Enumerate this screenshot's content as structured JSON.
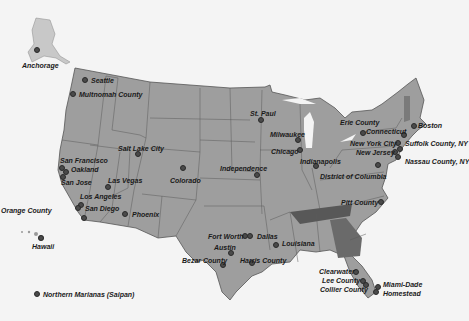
{
  "colors": {
    "background": "#f4f4f4",
    "land": "#9a9a9a",
    "state_border": "#5a5a5a",
    "highlight_tennessee": "#5a5a5a",
    "highlight_georgia": "#6a6a6a",
    "highlight_vermont": "#7a7a7a",
    "marker": "#4a4a4a"
  },
  "locations": [
    {
      "name": "Anchorage",
      "x": 37,
      "y": 50,
      "lx": 22,
      "ly": 62
    },
    {
      "name": "Seattle",
      "x": 85,
      "y": 80,
      "lx": 91,
      "ly": 77
    },
    {
      "name": "Multnomah County",
      "x": 73,
      "y": 94,
      "lx": 79,
      "ly": 91
    },
    {
      "name": "San Francisco",
      "x": 62,
      "y": 168,
      "lx": 60,
      "ly": 157
    },
    {
      "name": "Oakland",
      "x": 66,
      "y": 172,
      "lx": 71,
      "ly": 166
    },
    {
      "name": "San Jose",
      "x": 63,
      "y": 177,
      "lx": 61,
      "ly": 179
    },
    {
      "name": "Los Angeles",
      "x": 81,
      "y": 205,
      "lx": 80,
      "ly": 193
    },
    {
      "name": "San Diego",
      "x": 84,
      "y": 218,
      "lx": 85,
      "ly": 205
    },
    {
      "name": "Orange County",
      "x": 78,
      "y": 208,
      "lx": 1,
      "ly": 207
    },
    {
      "name": "Las Vegas",
      "x": 108,
      "y": 187,
      "lx": 108,
      "ly": 177
    },
    {
      "name": "Salt Lake City",
      "x": 138,
      "y": 154,
      "lx": 118,
      "ly": 145
    },
    {
      "name": "Colorado",
      "x": 183,
      "y": 168,
      "lx": 170,
      "ly": 177
    },
    {
      "name": "Phoenix",
      "x": 125,
      "y": 214,
      "lx": 132,
      "ly": 211
    },
    {
      "name": "Independence",
      "x": 257,
      "y": 175,
      "lx": 220,
      "ly": 165
    },
    {
      "name": "St. Paul",
      "x": 261,
      "y": 120,
      "lx": 250,
      "ly": 110
    },
    {
      "name": "Milwaukee",
      "x": 298,
      "y": 140,
      "lx": 270,
      "ly": 131
    },
    {
      "name": "Chicago",
      "x": 300,
      "y": 150,
      "lx": 271,
      "ly": 148
    },
    {
      "name": "Indianapolis",
      "x": 316,
      "y": 166,
      "lx": 300,
      "ly": 158
    },
    {
      "name": "District of Columbia",
      "x": 378,
      "y": 165,
      "lx": 320,
      "ly": 173
    },
    {
      "name": "Erie County",
      "x": 363,
      "y": 133,
      "lx": 340,
      "ly": 119
    },
    {
      "name": "Connecticut",
      "x": 404,
      "y": 135,
      "lx": 366,
      "ly": 128
    },
    {
      "name": "Boston",
      "x": 414,
      "y": 126,
      "lx": 418,
      "ly": 122
    },
    {
      "name": "New York City",
      "x": 398,
      "y": 143,
      "lx": 350,
      "ly": 140
    },
    {
      "name": "Suffolk County, NY",
      "x": 400,
      "y": 149,
      "lx": 405,
      "ly": 140
    },
    {
      "name": "New Jersey",
      "x": 395,
      "y": 152,
      "lx": 356,
      "ly": 149
    },
    {
      "name": "Nassau County, NY",
      "x": 398,
      "y": 157,
      "lx": 405,
      "ly": 158
    },
    {
      "name": "Pitt County",
      "x": 381,
      "y": 202,
      "lx": 341,
      "ly": 199
    },
    {
      "name": "Fort Worth",
      "x": 245,
      "y": 236,
      "lx": 208,
      "ly": 233
    },
    {
      "name": "Dallas",
      "x": 250,
      "y": 236,
      "lx": 257,
      "ly": 233
    },
    {
      "name": "Austin",
      "x": 231,
      "y": 253,
      "lx": 214,
      "ly": 244
    },
    {
      "name": "Bezar County",
      "x": 223,
      "y": 265,
      "lx": 182,
      "ly": 257
    },
    {
      "name": "Harris County",
      "x": 252,
      "y": 263,
      "lx": 240,
      "ly": 257
    },
    {
      "name": "Louisiana",
      "x": 276,
      "y": 245,
      "lx": 282,
      "ly": 240
    },
    {
      "name": "Clearwater",
      "x": 356,
      "y": 272,
      "lx": 319,
      "ly": 268
    },
    {
      "name": "Lee County",
      "x": 363,
      "y": 281,
      "lx": 322,
      "ly": 277
    },
    {
      "name": "Collier County",
      "x": 366,
      "y": 285,
      "lx": 320,
      "ly": 286
    },
    {
      "name": "Miami-Dade",
      "x": 378,
      "y": 287,
      "lx": 383,
      "ly": 281
    },
    {
      "name": "Homestead",
      "x": 376,
      "y": 292,
      "lx": 383,
      "ly": 290
    },
    {
      "name": "Hawaii",
      "x": 41,
      "y": 238,
      "lx": 32,
      "ly": 243
    },
    {
      "name": "Northern Marianas (Saipan)",
      "x": 37,
      "y": 294,
      "lx": 43,
      "ly": 291
    }
  ]
}
